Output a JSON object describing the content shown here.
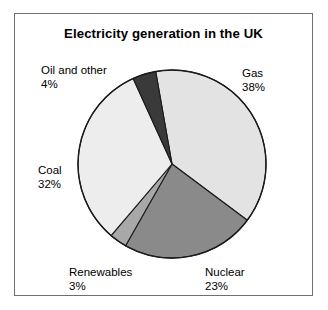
{
  "figure": {
    "title": "Electricity generation in the UK",
    "frame_color": "#6f6f6f",
    "background": "#ffffff"
  },
  "chart_data": {
    "type": "pie",
    "title": "Electricity generation in the UK",
    "xlabel": "",
    "ylabel": "",
    "units": "percent",
    "legend_position": "none",
    "labels_outside": true,
    "grid": false,
    "start_angle_deg": -10,
    "direction": "clockwise",
    "categories": [
      "Gas",
      "Nuclear",
      "Renewables",
      "Coal",
      "Oil and other"
    ],
    "values": [
      38,
      23,
      3,
      32,
      4
    ],
    "value_labels": [
      "38%",
      "23%",
      "3%",
      "32%",
      "4%"
    ],
    "colors": [
      "#e3e3e3",
      "#8a8a8a",
      "#a8a8a8",
      "#ededed",
      "#3a3a3a"
    ],
    "slices": [
      {
        "name": "Gas",
        "value": 38,
        "label": "Gas",
        "pct": "38%",
        "color": "#e3e3e3"
      },
      {
        "name": "Nuclear",
        "value": 23,
        "label": "Nuclear",
        "pct": "23%",
        "color": "#8a8a8a"
      },
      {
        "name": "Renewables",
        "value": 3,
        "label": "Renewables",
        "pct": "3%",
        "color": "#a8a8a8"
      },
      {
        "name": "Coal",
        "value": 32,
        "label": "Coal",
        "pct": "32%",
        "color": "#ededed"
      },
      {
        "name": "Oil and other",
        "value": 4,
        "label": "Oil and other",
        "pct": "4%",
        "color": "#3a3a3a"
      }
    ]
  }
}
